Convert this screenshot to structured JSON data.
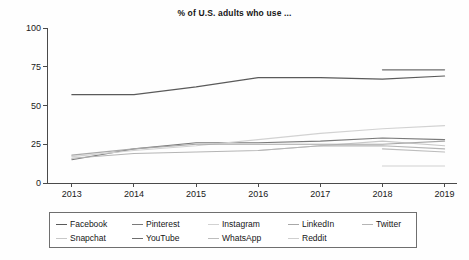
{
  "chart_data": {
    "type": "line",
    "title": "% of U.S. adults who use ...",
    "xlabel": "",
    "ylabel": "",
    "x": [
      2013,
      2014,
      2015,
      2016,
      2017,
      2018,
      2019
    ],
    "xlim": [
      2012.6,
      2019.2
    ],
    "ylim": [
      0,
      100
    ],
    "yticks": [
      0,
      25,
      50,
      75,
      100
    ],
    "xticks": [
      2013,
      2014,
      2015,
      2016,
      2017,
      2018,
      2019
    ],
    "grid": false,
    "legend_position": "below",
    "series": [
      {
        "name": "Facebook",
        "color": "#5a5a5a",
        "values": [
          57,
          57,
          62,
          68,
          68,
          67,
          69
        ]
      },
      {
        "name": "Snapchat",
        "color": "#c8c8c8",
        "values": [
          null,
          null,
          null,
          21,
          24,
          27,
          24
        ]
      },
      {
        "name": "Pinterest",
        "color": "#7a7a7a",
        "values": [
          15,
          22,
          26,
          26,
          27,
          29,
          28
        ]
      },
      {
        "name": "YouTube",
        "color": "#6e6e6e",
        "values": [
          null,
          null,
          null,
          null,
          null,
          73,
          73
        ]
      },
      {
        "name": "Instagram",
        "color": "#d2d2d2",
        "values": [
          17,
          21,
          24,
          28,
          32,
          35,
          37
        ]
      },
      {
        "name": "WhatsApp",
        "color": "#bdbdbd",
        "values": [
          null,
          null,
          null,
          null,
          null,
          22,
          20
        ]
      },
      {
        "name": "LinkedIn",
        "color": "#a8a8a8",
        "values": [
          18,
          22,
          25,
          25,
          25,
          25,
          27
        ]
      },
      {
        "name": "Reddit",
        "color": "#cfcfcf",
        "values": [
          null,
          null,
          null,
          null,
          null,
          11,
          11
        ]
      },
      {
        "name": "Twitter",
        "color": "#b5b5b5",
        "values": [
          16,
          19,
          20,
          21,
          24,
          24,
          22
        ]
      }
    ]
  },
  "chart": {
    "title": "% of U.S. adults who use ...",
    "y_tick_labels": [
      "100",
      "75",
      "50",
      "25",
      "0"
    ],
    "x_tick_labels": [
      "2013",
      "2014",
      "2015",
      "2016",
      "2017",
      "2018",
      "2019"
    ]
  },
  "legend": {
    "entries": [
      {
        "label": "Facebook",
        "color": "#5a5a5a"
      },
      {
        "label": "Pinterest",
        "color": "#7a7a7a"
      },
      {
        "label": "Instagram",
        "color": "#d2d2d2"
      },
      {
        "label": "LinkedIn",
        "color": "#a8a8a8"
      },
      {
        "label": "Twitter",
        "color": "#b5b5b5"
      },
      {
        "label": "Snapchat",
        "color": "#c8c8c8"
      },
      {
        "label": "YouTube",
        "color": "#6e6e6e"
      },
      {
        "label": "WhatsApp",
        "color": "#bdbdbd"
      },
      {
        "label": "Reddit",
        "color": "#cfcfcf"
      }
    ]
  }
}
